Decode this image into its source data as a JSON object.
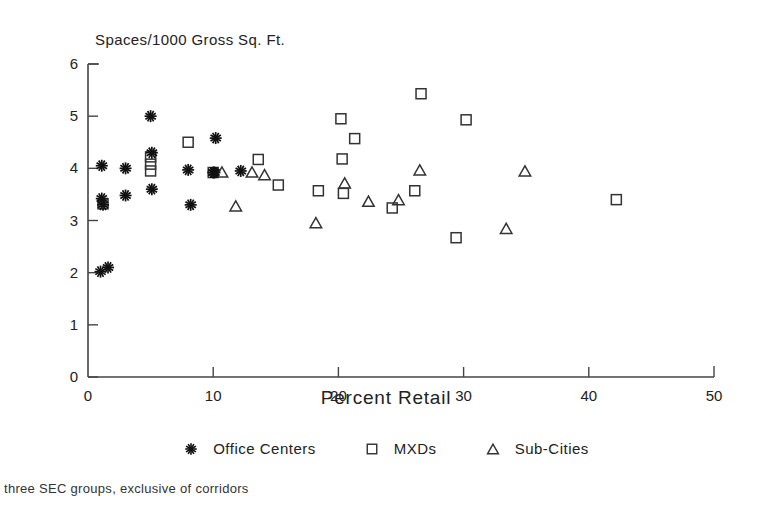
{
  "chart_data": {
    "type": "scatter",
    "title": "",
    "ylabel": "Spaces/1000 Gross Sq. Ft.",
    "xlabel": "Percent Retail",
    "xlim": [
      0,
      50
    ],
    "ylim": [
      0,
      6
    ],
    "xticks": [
      0,
      10,
      20,
      30,
      40,
      50
    ],
    "yticks": [
      0,
      1,
      2,
      3,
      4,
      5,
      6
    ],
    "grid": false,
    "legend_position": "bottom",
    "footnote": "three SEC groups, exclusive of corridors",
    "series": [
      {
        "name": "Office Centers",
        "marker": "asterisk-marker",
        "points": [
          [
            1.0,
            2.02
          ],
          [
            1.6,
            2.1
          ],
          [
            1.1,
            4.05
          ],
          [
            1.1,
            3.42
          ],
          [
            1.2,
            3.3
          ],
          [
            3.0,
            4.0
          ],
          [
            3.0,
            3.48
          ],
          [
            5.0,
            5.0
          ],
          [
            5.1,
            4.3
          ],
          [
            5.1,
            3.6
          ],
          [
            8.0,
            3.97
          ],
          [
            8.2,
            3.3
          ],
          [
            10.2,
            4.58
          ],
          [
            10.0,
            3.92
          ],
          [
            10.1,
            3.92
          ],
          [
            12.2,
            3.95
          ]
        ]
      },
      {
        "name": "MXDs",
        "marker": "square-marker",
        "points": [
          [
            1.2,
            3.32
          ],
          [
            5.0,
            4.22
          ],
          [
            5.0,
            4.08
          ],
          [
            5.0,
            3.95
          ],
          [
            8.0,
            4.5
          ],
          [
            10.0,
            3.92
          ],
          [
            13.6,
            4.17
          ],
          [
            15.2,
            3.68
          ],
          [
            18.4,
            3.57
          ],
          [
            20.2,
            4.95
          ],
          [
            20.3,
            4.18
          ],
          [
            20.4,
            3.52
          ],
          [
            21.3,
            4.57
          ],
          [
            24.3,
            3.24
          ],
          [
            26.6,
            5.43
          ],
          [
            26.1,
            3.57
          ],
          [
            29.4,
            2.67
          ],
          [
            30.2,
            4.93
          ],
          [
            42.2,
            3.4
          ]
        ]
      },
      {
        "name": "Sub-Cities",
        "marker": "triangle-marker",
        "points": [
          [
            10.7,
            3.93
          ],
          [
            11.8,
            3.28
          ],
          [
            13.1,
            3.93
          ],
          [
            14.1,
            3.88
          ],
          [
            18.2,
            2.96
          ],
          [
            20.5,
            3.72
          ],
          [
            22.4,
            3.37
          ],
          [
            24.8,
            3.4
          ],
          [
            26.5,
            3.97
          ],
          [
            34.9,
            3.95
          ],
          [
            33.4,
            2.85
          ]
        ]
      }
    ]
  },
  "legend": {
    "items": [
      {
        "label": "Office Centers",
        "marker": "asterisk-marker"
      },
      {
        "label": "MXDs",
        "marker": "square-marker"
      },
      {
        "label": "Sub-Cities",
        "marker": "triangle-marker"
      }
    ]
  },
  "colors": {
    "ink": "#1a1a1a",
    "axis": "#444444",
    "background": "#ffffff"
  }
}
